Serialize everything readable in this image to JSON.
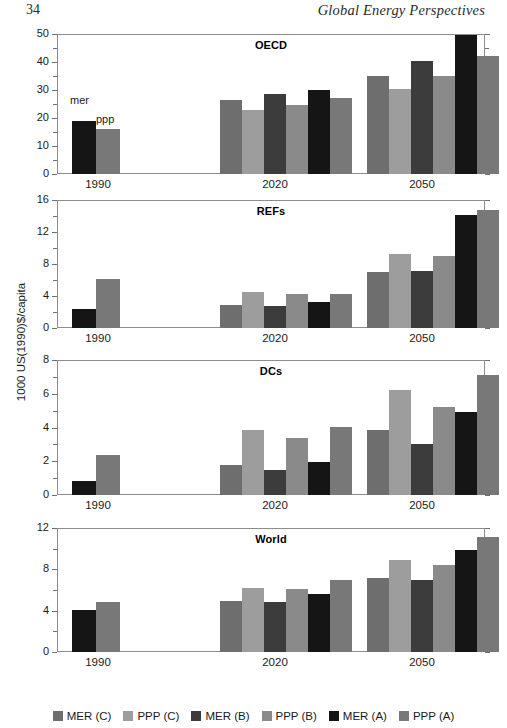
{
  "page": {
    "folio": "34",
    "running_head": "Global Energy Perspectives"
  },
  "yaxis_title": "1000 US(1990)$/capita",
  "series_colors": {
    "MER (C)": "#6e6e6e",
    "PPP (C)": "#9d9d9d",
    "MER (B)": "#3c3c3c",
    "PPP (B)": "#8a8a8a",
    "MER (A)": "#151515",
    "PPP (A)": "#787878"
  },
  "legend": {
    "items": [
      {
        "label": "MER (C)",
        "color": "#6e6e6e"
      },
      {
        "label": "PPP (C)",
        "color": "#9d9d9d"
      },
      {
        "label": "MER (B)",
        "color": "#3c3c3c"
      },
      {
        "label": "PPP (B)",
        "color": "#8a8a8a"
      },
      {
        "label": "MER (A)",
        "color": "#151515"
      },
      {
        "label": "PPP (A)",
        "color": "#787878"
      }
    ]
  },
  "annotations_1990": {
    "mer": "mer",
    "ppp": "ppp"
  },
  "chart_data": [
    {
      "type": "bar",
      "title": "OECD",
      "xlabel": "",
      "ylabel": "1000 US(1990)$/capita",
      "ylim": [
        0,
        50
      ],
      "yticks": [
        0,
        10,
        20,
        30,
        40,
        50
      ],
      "ytick_labels": [
        "0",
        "10",
        "20",
        "30",
        "40",
        "50"
      ],
      "grid": false,
      "legend_position": "bottom",
      "categories": [
        "1990",
        "2020",
        "2050"
      ],
      "series": [
        {
          "name": "MER (C)",
          "values": [
            null,
            26.5,
            35.0
          ]
        },
        {
          "name": "PPP (C)",
          "values": [
            null,
            23.0,
            30.5
          ]
        },
        {
          "name": "MER (B)",
          "values": [
            null,
            28.7,
            40.5
          ]
        },
        {
          "name": "PPP (B)",
          "values": [
            null,
            24.5,
            35.0
          ]
        },
        {
          "name": "MER (A)",
          "values": [
            19.0,
            30.0,
            49.5
          ]
        },
        {
          "name": "PPP (A)",
          "values": [
            16.0,
            27.0,
            42.0
          ]
        }
      ]
    },
    {
      "type": "bar",
      "title": "REFs",
      "xlabel": "",
      "ylabel": "1000 US(1990)$/capita",
      "ylim": [
        0,
        16
      ],
      "yticks": [
        0,
        4,
        8,
        12,
        16
      ],
      "ytick_labels": [
        "0",
        "4",
        "8",
        "12",
        "16"
      ],
      "grid": false,
      "legend_position": "bottom",
      "categories": [
        "1990",
        "2020",
        "2050"
      ],
      "series": [
        {
          "name": "MER (C)",
          "values": [
            null,
            2.9,
            7.0
          ]
        },
        {
          "name": "PPP (C)",
          "values": [
            null,
            4.5,
            9.2
          ]
        },
        {
          "name": "MER (B)",
          "values": [
            null,
            2.7,
            7.1
          ]
        },
        {
          "name": "PPP (B)",
          "values": [
            null,
            4.3,
            9.0
          ]
        },
        {
          "name": "MER (A)",
          "values": [
            2.4,
            3.3,
            14.1
          ]
        },
        {
          "name": "PPP (A)",
          "values": [
            6.1,
            4.3,
            14.7
          ]
        }
      ]
    },
    {
      "type": "bar",
      "title": "DCs",
      "xlabel": "",
      "ylabel": "1000 US(1990)$/capita",
      "ylim": [
        0,
        8
      ],
      "yticks": [
        0,
        2,
        4,
        6,
        8
      ],
      "ytick_labels": [
        "0",
        "2",
        "4",
        "6",
        "8"
      ],
      "grid": false,
      "legend_position": "bottom",
      "categories": [
        "1990",
        "2020",
        "2050"
      ],
      "series": [
        {
          "name": "MER (C)",
          "values": [
            null,
            1.8,
            3.85
          ]
        },
        {
          "name": "PPP (C)",
          "values": [
            null,
            3.85,
            6.2
          ]
        },
        {
          "name": "MER (B)",
          "values": [
            null,
            1.5,
            3.0
          ]
        },
        {
          "name": "PPP (B)",
          "values": [
            null,
            3.35,
            5.2
          ]
        },
        {
          "name": "MER (A)",
          "values": [
            0.85,
            1.95,
            4.9
          ]
        },
        {
          "name": "PPP (A)",
          "values": [
            2.35,
            4.05,
            7.1
          ]
        }
      ]
    },
    {
      "type": "bar",
      "title": "World",
      "xlabel": "",
      "ylabel": "1000 US(1990)$/capita",
      "ylim": [
        0,
        12
      ],
      "yticks": [
        0,
        4,
        8,
        12
      ],
      "ytick_labels": [
        "0",
        "4",
        "8",
        "12"
      ],
      "minor_yticks": [
        2,
        6,
        10
      ],
      "grid": false,
      "legend_position": "bottom",
      "categories": [
        "1990",
        "2020",
        "2050"
      ],
      "series": [
        {
          "name": "MER (C)",
          "values": [
            null,
            4.9,
            7.15
          ]
        },
        {
          "name": "PPP (C)",
          "values": [
            null,
            6.2,
            8.9
          ]
        },
        {
          "name": "MER (B)",
          "values": [
            null,
            4.85,
            6.95
          ]
        },
        {
          "name": "PPP (B)",
          "values": [
            null,
            6.05,
            8.4
          ]
        },
        {
          "name": "MER (A)",
          "values": [
            4.1,
            5.6,
            9.9
          ]
        },
        {
          "name": "PPP (A)",
          "values": [
            4.8,
            6.95,
            11.15
          ]
        }
      ]
    }
  ]
}
